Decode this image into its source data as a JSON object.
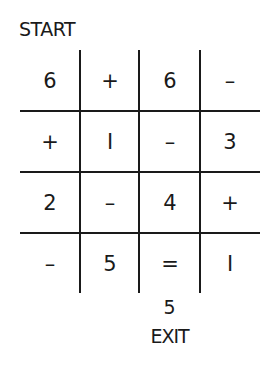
{
  "puzzle": {
    "start_label": "START",
    "exit_label": "EXIT",
    "exit_value": "5",
    "rows": 4,
    "cols": 4,
    "cells": [
      [
        "6",
        "+",
        "6",
        "–"
      ],
      [
        "+",
        "I",
        "–",
        "3"
      ],
      [
        "2",
        "–",
        "4",
        "+"
      ],
      [
        "–",
        "5",
        "=",
        "I"
      ]
    ],
    "line_color": "#1a1a1a",
    "background_color": "#ffffff"
  }
}
